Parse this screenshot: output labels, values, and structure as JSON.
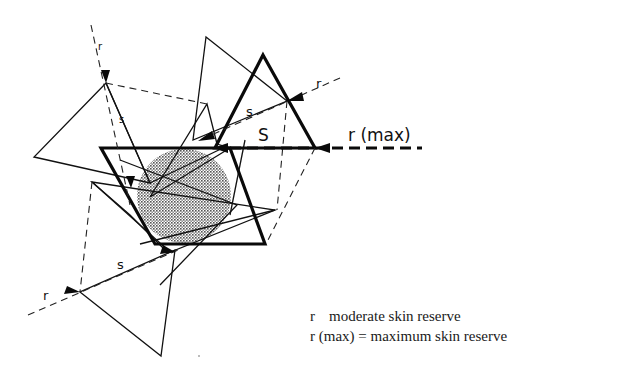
{
  "figure": {
    "labels": {
      "r_top_left": "r",
      "s_top_left": "s",
      "r_top_right": "r",
      "s_top_right": "s",
      "S_main": "S",
      "r_max": "r (max)",
      "s_bottom": "s",
      "r_bottom": "r"
    },
    "colors": {
      "stroke": "#111111",
      "stipple": "#8a8a8a",
      "background": "#ffffff"
    }
  },
  "legend": {
    "items": [
      {
        "symbol": "r",
        "separator": "",
        "text": "moderate skin reserve"
      },
      {
        "symbol": "r (max)",
        "separator": "=",
        "text": "maximum skin reserve"
      }
    ]
  }
}
